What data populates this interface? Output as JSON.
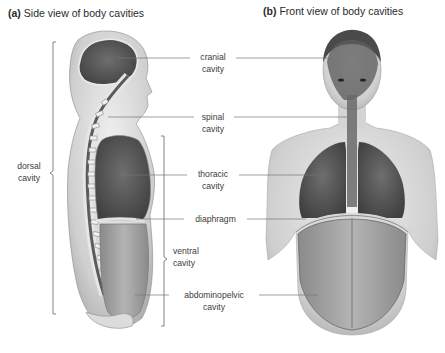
{
  "panels": {
    "a": {
      "letter": "(a)",
      "title": "Side view of body cavities"
    },
    "b": {
      "letter": "(b)",
      "title": "Front view of body cavities"
    }
  },
  "labels": {
    "cranial": {
      "line1": "cranial",
      "line2": "cavity"
    },
    "spinal": {
      "line1": "spinal",
      "line2": "cavity"
    },
    "thoracic": {
      "line1": "thoracic",
      "line2": "cavity"
    },
    "diaphragm": {
      "line1": "diaphragm"
    },
    "abdominopelvic": {
      "line1": "abdominopelvic",
      "line2": "cavity"
    },
    "dorsal": {
      "line1": "dorsal",
      "line2": "cavity"
    },
    "ventral": {
      "line1": "ventral",
      "line2": "cavity"
    }
  },
  "groupings": {
    "dorsal_cavity": [
      "cranial cavity",
      "spinal cavity"
    ],
    "ventral_cavity": [
      "thoracic cavity",
      "diaphragm",
      "abdominopelvic cavity"
    ]
  },
  "colors": {
    "text": "#3c3c3c",
    "leader_line": "#777777",
    "cavity_dark": "#5a5a5a",
    "cavity_light": "#9a9a9a",
    "skin": "#d9d9d9",
    "bone": "#e8e8e8"
  }
}
